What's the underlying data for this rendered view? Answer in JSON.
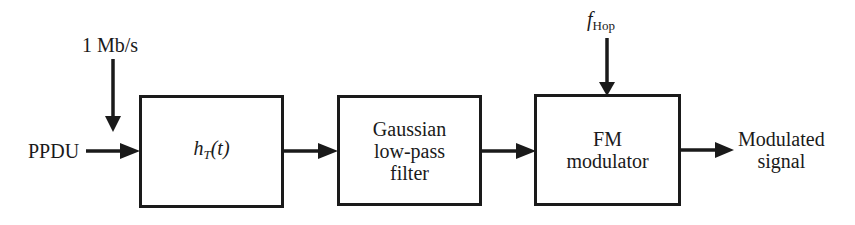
{
  "diagram": {
    "input_label": "PPDU",
    "rate_label": "1 Mb/s",
    "blocks": [
      {
        "id": "ht",
        "label_main": "h",
        "label_sub": "T",
        "label_arg": "(t)"
      },
      {
        "id": "gaussian",
        "lines": [
          "Gaussian",
          "low-pass",
          "filter"
        ]
      },
      {
        "id": "fm",
        "lines": [
          "FM",
          "modulator"
        ]
      }
    ],
    "hop_label_main": "f",
    "hop_label_sub": "Hop",
    "output_lines": [
      "Modulated",
      "signal"
    ],
    "colors": {
      "stroke": "#1a1a1a",
      "background": "#ffffff"
    }
  }
}
